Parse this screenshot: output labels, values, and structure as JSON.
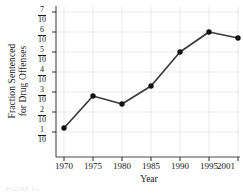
{
  "chart_data": {
    "type": "line",
    "title": "",
    "xlabel": "Year",
    "ylabel_line1": "Fraction Sentenced",
    "ylabel_line2": "for Drug Offenses",
    "x": [
      1970,
      1975,
      1980,
      1985,
      1990,
      1995,
      2001
    ],
    "xtick_labels": [
      "1970",
      "1975",
      "1980",
      "1985",
      "1990",
      "1995",
      "2001"
    ],
    "values": [
      0.12,
      0.28,
      0.24,
      0.33,
      0.5,
      0.6,
      0.57
    ],
    "ytick_values": [
      0.1,
      0.2,
      0.3,
      0.4,
      0.5,
      0.6,
      0.7
    ],
    "ytick_numerators": [
      "7",
      "6",
      "5",
      "4",
      "3",
      "2",
      "1"
    ],
    "ytick_denominators": [
      "10",
      "10",
      "10",
      "10",
      "10",
      "10",
      "10"
    ],
    "ytick_labels": [
      "7/10",
      "6/10",
      "5/10",
      "4/10",
      "3/10",
      "2/10",
      "1/10"
    ],
    "ylim": [
      0.05,
      0.72
    ],
    "xlim": [
      1968.5,
      2002.5
    ],
    "grid": true,
    "legend": "none",
    "marker": "filled-circle",
    "line_color": "#3a3a3a",
    "marker_color": "#111111",
    "grid_color": "#e2e2e2",
    "axis_color": "#4a4a4a",
    "background_color": "#ffffff"
  },
  "figure": {
    "caption": "FIGURE 4.2"
  }
}
